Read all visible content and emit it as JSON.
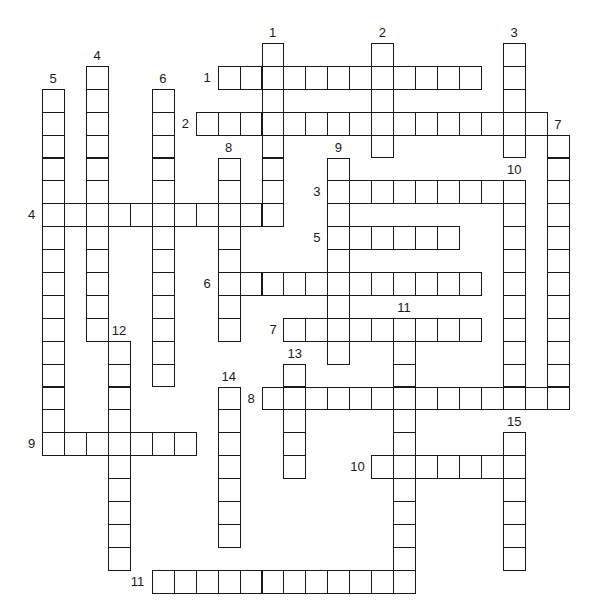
{
  "puzzle": {
    "type": "crossword",
    "across": [
      {
        "number": "1",
        "row": 1,
        "col": 8,
        "length": 12
      },
      {
        "number": "2",
        "row": 3,
        "col": 7,
        "length": 16
      },
      {
        "number": "3",
        "row": 6,
        "col": 13,
        "length": 9
      },
      {
        "number": "4",
        "row": 7,
        "col": 0,
        "length": 11
      },
      {
        "number": "5",
        "row": 8,
        "col": 13,
        "length": 6
      },
      {
        "number": "6",
        "row": 10,
        "col": 8,
        "length": 12
      },
      {
        "number": "7",
        "row": 12,
        "col": 11,
        "length": 9
      },
      {
        "number": "8",
        "row": 15,
        "col": 10,
        "length": 14
      },
      {
        "number": "9",
        "row": 17,
        "col": 0,
        "length": 7
      },
      {
        "number": "10",
        "row": 18,
        "col": 15,
        "length": 7
      },
      {
        "number": "11",
        "row": 23,
        "col": 5,
        "length": 12
      }
    ],
    "down": [
      {
        "number": "1",
        "row": 0,
        "col": 10,
        "length": 8
      },
      {
        "number": "2",
        "row": 0,
        "col": 15,
        "length": 5
      },
      {
        "number": "3",
        "row": 0,
        "col": 21,
        "length": 5
      },
      {
        "number": "4",
        "row": 1,
        "col": 2,
        "length": 12
      },
      {
        "number": "5",
        "row": 2,
        "col": 0,
        "length": 16
      },
      {
        "number": "6",
        "row": 2,
        "col": 5,
        "length": 13
      },
      {
        "number": "7",
        "row": 4,
        "col": 23,
        "length": 12
      },
      {
        "number": "8",
        "row": 5,
        "col": 8,
        "length": 8
      },
      {
        "number": "9",
        "row": 5,
        "col": 13,
        "length": 9
      },
      {
        "number": "10",
        "row": 6,
        "col": 21,
        "length": 10
      },
      {
        "number": "11",
        "row": 12,
        "col": 16,
        "length": 12
      },
      {
        "number": "12",
        "row": 13,
        "col": 3,
        "length": 10
      },
      {
        "number": "13",
        "row": 14,
        "col": 11,
        "length": 5
      },
      {
        "number": "14",
        "row": 15,
        "col": 8,
        "length": 7
      },
      {
        "number": "15",
        "row": 17,
        "col": 21,
        "length": 6
      }
    ]
  }
}
